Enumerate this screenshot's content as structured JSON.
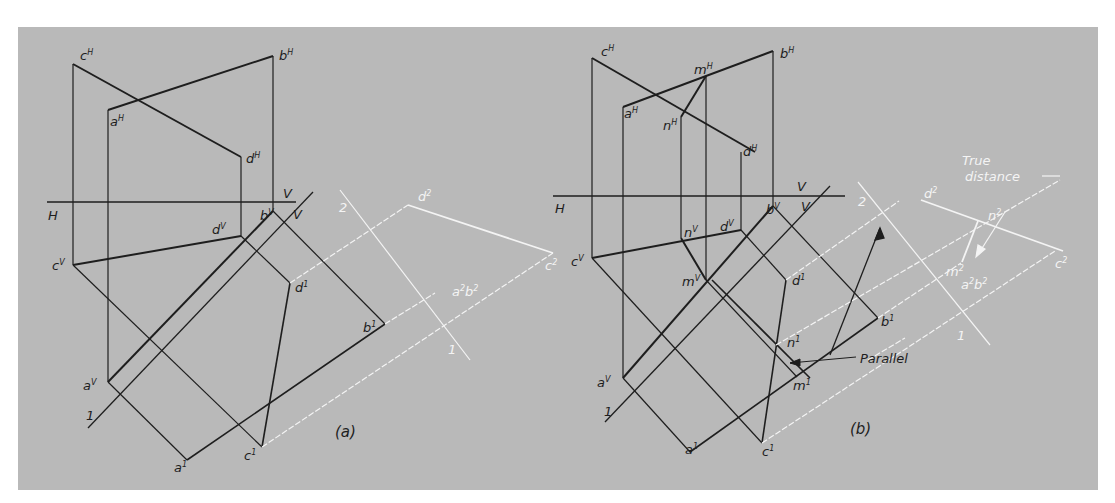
{
  "figure": {
    "background": "#b9b9b9",
    "line_color_dark": "#1e1e1e",
    "line_color_light": "#f4f4f4"
  },
  "panel_a": {
    "caption": "(a)",
    "labels": {
      "cH": "c",
      "cH_sup": "H",
      "bH": "b",
      "bH_sup": "H",
      "aH": "a",
      "aH_sup": "H",
      "dH": "d",
      "dH_sup": "H",
      "H": "H",
      "V_top": "V",
      "V_diag": "V",
      "cV": "c",
      "cV_sup": "V",
      "aV": "a",
      "aV_sup": "V",
      "dV": "d",
      "dV_sup": "V",
      "bV": "b",
      "bV_sup": "V",
      "a1": "a",
      "a1_sup": "1",
      "c1": "c",
      "c1_sup": "1",
      "d1": "d",
      "d1_sup": "1",
      "b1": "b",
      "b1_sup": "1",
      "line_1": "1",
      "plane_2": "2",
      "plane_1": "1",
      "d2": "d",
      "d2_sup": "2",
      "c2": "c",
      "c2_sup": "2",
      "a2b2": "a",
      "a2b2_sup1": "2",
      "a2b2_mid": "b",
      "a2b2_sup2": "2"
    }
  },
  "panel_b": {
    "caption": "(b)",
    "annotation_parallel": "Parallel",
    "annotation_true_line1": "True",
    "annotation_true_line2": "distance",
    "labels": {
      "cH": "c",
      "cH_sup": "H",
      "bH": "b",
      "bH_sup": "H",
      "mH": "m",
      "mH_sup": "H",
      "aH": "a",
      "aH_sup": "H",
      "nH": "n",
      "nH_sup": "H",
      "dH": "d",
      "dH_sup": "H",
      "H": "H",
      "V_top": "V",
      "V_diag": "V",
      "cV": "c",
      "cV_sup": "V",
      "nV": "n",
      "nV_sup": "V",
      "dV": "d",
      "dV_sup": "V",
      "bV": "b",
      "bV_sup": "V",
      "mV": "m",
      "mV_sup": "V",
      "aV": "a",
      "aV_sup": "V",
      "d1": "d",
      "d1_sup": "1",
      "b1": "b",
      "b1_sup": "1",
      "n1": "n",
      "n1_sup": "1",
      "m1": "m",
      "m1_sup": "1",
      "a1": "a",
      "a1_sup": "1",
      "c1": "c",
      "c1_sup": "1",
      "line_1": "1",
      "plane_2": "2",
      "plane_1": "1",
      "d2": "d",
      "d2_sup": "2",
      "n2": "n",
      "n2_sup": "2",
      "m2": "m",
      "m2_sup": "2",
      "c2": "c",
      "c2_sup": "2",
      "a2b2": "a",
      "a2b2_sup1": "2",
      "a2b2_mid": "b",
      "a2b2_sup2": "2"
    }
  }
}
